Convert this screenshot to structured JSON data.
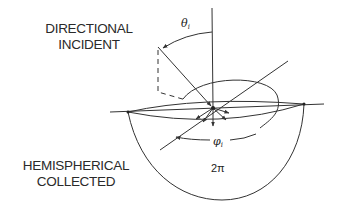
{
  "diagram": {
    "incident_label": [
      "DIRECTIONAL",
      "INCIDENT"
    ],
    "collected_label": [
      "HEMISPHERICAL",
      "COLLECTED"
    ],
    "theta_symbol": "θ",
    "theta_subscript": "i",
    "phi_symbol": "φ",
    "phi_subscript": "i",
    "solid_angle_label": "2π",
    "line_color": "#333333"
  }
}
